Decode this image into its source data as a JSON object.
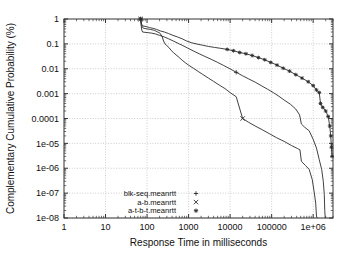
{
  "chart_data": {
    "type": "line",
    "title": "",
    "subtitle": "",
    "xlabel": "Response Time in milliseconds",
    "ylabel": "Complementary Cumulative Probability (%)",
    "xscale": "log",
    "yscale": "log",
    "xlim": [
      1,
      3000000
    ],
    "ylim": [
      1e-08,
      1
    ],
    "xticks": [
      1,
      10,
      100,
      1000,
      10000,
      100000,
      1000000
    ],
    "xtick_labels": [
      "1",
      "10",
      "100",
      "1000",
      "10000",
      "100000",
      "1e+06"
    ],
    "yticks": [
      1,
      0.1,
      0.01,
      0.001,
      0.0001,
      1e-05,
      1e-06,
      1e-07,
      1e-08
    ],
    "ytick_labels": [
      "1",
      "0.1",
      "0.01",
      "0.001",
      "0.0001",
      "1e-05",
      "1e-06",
      "1e-07",
      "1e-08"
    ],
    "grid": true,
    "legend_position": "bottom-left",
    "line_color": "#2b2b2b",
    "grid_color": "#b9b9b9",
    "axis_color": "#333333",
    "series": [
      {
        "name": "blk-seq.meanrtt",
        "marker": "+",
        "points": [
          [
            70,
            1.0
          ],
          [
            72,
            0.55
          ],
          [
            75,
            0.35
          ],
          [
            78,
            0.3
          ],
          [
            90,
            0.29
          ],
          [
            110,
            0.28
          ],
          [
            130,
            0.27
          ],
          [
            160,
            0.25
          ],
          [
            200,
            0.22
          ],
          [
            260,
            0.19
          ],
          [
            330,
            0.16
          ],
          [
            430,
            0.13
          ],
          [
            560,
            0.105
          ],
          [
            730,
            0.085
          ],
          [
            950,
            0.068
          ],
          [
            1300,
            0.052
          ],
          [
            1800,
            0.04
          ],
          [
            2500,
            0.031
          ],
          [
            3500,
            0.024
          ],
          [
            5000,
            0.018
          ],
          [
            7000,
            0.0135
          ],
          [
            10000,
            0.0099
          ],
          [
            14000,
            0.0072
          ],
          [
            20000,
            0.0052
          ],
          [
            28000,
            0.0039
          ],
          [
            40000,
            0.0029
          ],
          [
            56000,
            0.0021
          ],
          [
            80000,
            0.0015
          ],
          [
            110000,
            0.0011
          ],
          [
            150000,
            0.00078
          ],
          [
            200000,
            0.00055
          ],
          [
            280000,
            0.00038
          ],
          [
            380000,
            0.00024
          ],
          [
            470000,
            0.00014
          ],
          [
            520000,
            6e-05
          ],
          [
            620000,
            4.5e-05
          ],
          [
            800000,
            3.2e-05
          ],
          [
            1000000,
            1.45e-05
          ],
          [
            1200000,
            6.5e-06
          ],
          [
            1400000,
            2.2e-06
          ],
          [
            1600000,
            9e-07
          ],
          [
            1750000,
            3e-07
          ],
          [
            1850000,
            9e-08
          ],
          [
            1900000,
            2e-08
          ],
          [
            1950000,
            1e-08
          ]
        ]
      },
      {
        "name": "a-b.meanrtt",
        "marker": "x",
        "points": [
          [
            70,
            1.0
          ],
          [
            73,
            0.6
          ],
          [
            78,
            0.45
          ],
          [
            85,
            0.42
          ],
          [
            100,
            0.4
          ],
          [
            120,
            0.38
          ],
          [
            150,
            0.35
          ],
          [
            180,
            0.3
          ],
          [
            200,
            0.28
          ],
          [
            230,
            0.2
          ],
          [
            250,
            0.13
          ],
          [
            270,
            0.1
          ],
          [
            300,
            0.085
          ],
          [
            340,
            0.07
          ],
          [
            380,
            0.055
          ],
          [
            430,
            0.045
          ],
          [
            500,
            0.036
          ],
          [
            600,
            0.028
          ],
          [
            700,
            0.022
          ],
          [
            850,
            0.017
          ],
          [
            1000,
            0.014
          ],
          [
            1300,
            0.0105
          ],
          [
            1700,
            0.0078
          ],
          [
            2200,
            0.0059
          ],
          [
            3000,
            0.0042
          ],
          [
            4000,
            0.0031
          ],
          [
            5500,
            0.0022
          ],
          [
            7500,
            0.0016
          ],
          [
            10000,
            0.0011
          ],
          [
            14000,
            0.00075
          ],
          [
            20000,
            0.0001
          ],
          [
            28000,
            7e-05
          ],
          [
            40000,
            5e-05
          ],
          [
            60000,
            3.5e-05
          ],
          [
            90000,
            2.4e-05
          ],
          [
            130000,
            1.7e-05
          ],
          [
            200000,
            1.2e-05
          ],
          [
            300000,
            8.2e-06
          ],
          [
            420000,
            6.2e-06
          ],
          [
            480000,
            5.5e-06
          ],
          [
            520000,
            1.9e-06
          ],
          [
            650000,
            1.3e-06
          ],
          [
            800000,
            9e-07
          ],
          [
            950000,
            3.5e-07
          ],
          [
            1050000,
            1.2e-07
          ],
          [
            1150000,
            4e-08
          ],
          [
            1200000,
            1.2e-08
          ],
          [
            1250000,
            1e-08
          ]
        ]
      },
      {
        "name": "a-t-b-t.meanrtt",
        "marker": "*",
        "points": [
          [
            70,
            1.0
          ],
          [
            74,
            0.62
          ],
          [
            80,
            0.52
          ],
          [
            95,
            0.5
          ],
          [
            115,
            0.45
          ],
          [
            140,
            0.42
          ],
          [
            170,
            0.38
          ],
          [
            210,
            0.33
          ],
          [
            260,
            0.3
          ],
          [
            330,
            0.26
          ],
          [
            420,
            0.22
          ],
          [
            540,
            0.19
          ],
          [
            700,
            0.16
          ],
          [
            900,
            0.13
          ],
          [
            1200,
            0.11
          ],
          [
            1600,
            0.098
          ],
          [
            2200,
            0.088
          ],
          [
            3000,
            0.079
          ],
          [
            4200,
            0.072
          ],
          [
            6000,
            0.066
          ],
          [
            8500,
            0.06
          ],
          [
            12000,
            0.053
          ],
          [
            17000,
            0.045
          ],
          [
            24000,
            0.04
          ],
          [
            34000,
            0.034
          ],
          [
            48000,
            0.028
          ],
          [
            68000,
            0.023
          ],
          [
            95000,
            0.018
          ],
          [
            135000,
            0.014
          ],
          [
            190000,
            0.0105
          ],
          [
            270000,
            0.008
          ],
          [
            380000,
            0.0058
          ],
          [
            540000,
            0.0042
          ],
          [
            760000,
            0.003
          ],
          [
            1000000,
            0.0021
          ],
          [
            1200000,
            0.0014
          ],
          [
            1400000,
            0.0011
          ],
          [
            1500000,
            0.0004
          ],
          [
            1700000,
            0.00028
          ],
          [
            2000000,
            0.0002
          ],
          [
            2300000,
            0.00012
          ],
          [
            2500000,
            5e-05
          ],
          [
            2650000,
            2e-05
          ],
          [
            2750000,
            7e-06
          ],
          [
            2850000,
            3e-06
          ]
        ]
      }
    ],
    "legend": [
      {
        "label": "blk-seq.meanrtt",
        "marker": "+"
      },
      {
        "label": "a-b.meanrtt",
        "marker": "x"
      },
      {
        "label": "a-t-b-t.meanrtt",
        "marker": "*"
      }
    ]
  }
}
